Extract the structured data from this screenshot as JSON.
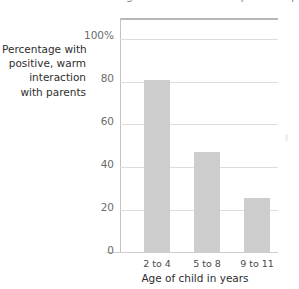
{
  "clipped_title": "Percentage of children with positive parental interaction",
  "y_axis_caption_lines": [
    "Percentage with",
    "positive, warm",
    "interaction",
    "with parents"
  ],
  "colors": {
    "bar_fill": "#cdcdcd",
    "gridline": "#dcdcdc",
    "frame": "#b7b7b7",
    "tick_text": "#6b6b6b",
    "label_text": "#2e2e2e"
  },
  "chart_data": {
    "type": "bar",
    "title": "",
    "subtitle": "",
    "categories": [
      "2 to 4",
      "5 to 8",
      "9 to 11"
    ],
    "values": [
      81,
      47,
      25.5
    ],
    "value_labels": [
      "81",
      "47",
      "25.5"
    ],
    "xlabel": "Age of child in years",
    "ylabel": "Percentage with positive, warm interaction with parents",
    "ylim": [
      0,
      110
    ],
    "ytick_values": [
      0,
      20,
      40,
      60,
      80,
      100
    ],
    "ytick_labels": [
      "0",
      "20",
      "40",
      "60",
      "80",
      "100%"
    ],
    "grid": true,
    "grid_axis": "y",
    "legend": false,
    "legend_position": "none",
    "series": [
      {
        "name": "Percentage with positive, warm interaction with parents",
        "values": [
          81,
          47,
          25.5
        ]
      }
    ]
  }
}
